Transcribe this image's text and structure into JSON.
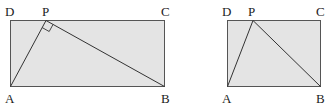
{
  "figures": [
    {
      "id": "left",
      "labels": {
        "A": "A",
        "B": "B",
        "C": "C",
        "D": "D",
        "P": "P"
      },
      "right_angle_at": "P",
      "fill": "#e4e4e4",
      "stroke": "#444444"
    },
    {
      "id": "right",
      "labels": {
        "A": "A",
        "B": "B",
        "C": "C",
        "D": "D",
        "P": "P"
      },
      "fill": "#e4e4e4",
      "stroke": "#444444"
    }
  ]
}
